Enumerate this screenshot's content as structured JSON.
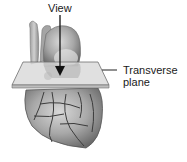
{
  "diagram": {
    "labels": {
      "view": "View",
      "plane_line1": "Transverse",
      "plane_line2": "plane"
    },
    "colors": {
      "heart_light": "#c8c8c8",
      "heart_mid": "#9a9a9a",
      "heart_dark": "#5a5a5a",
      "vessel": "#3c3c3c",
      "plane_fill": "#d9d9d9",
      "plane_edge": "#6e6e6e",
      "arrow": "#111111",
      "text": "#1a1a1a"
    }
  }
}
